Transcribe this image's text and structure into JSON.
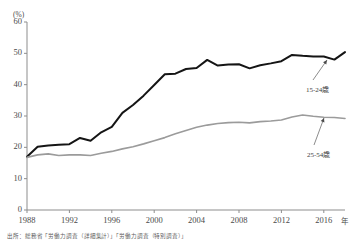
{
  "chart_data": {
    "type": "line",
    "title": "",
    "subtitle": "",
    "xlabel": "年",
    "ylabel": "(%)",
    "ylim": [
      0,
      60
    ],
    "xlim": [
      1988,
      2018
    ],
    "ytick_labels": [
      "0",
      "10",
      "20",
      "30",
      "40",
      "50",
      "60"
    ],
    "ytick_values": [
      0,
      10,
      20,
      30,
      40,
      50,
      60
    ],
    "xtick_labels": [
      "1988",
      "1992",
      "1996",
      "2000",
      "2004",
      "2008",
      "2012",
      "2016"
    ],
    "xtick_values": [
      1988,
      1992,
      1996,
      2000,
      2004,
      2008,
      2012,
      2016
    ],
    "grid": false,
    "legend_position": "inline-annotation",
    "x": [
      1988,
      1989,
      1990,
      1991,
      1992,
      1993,
      1994,
      1995,
      1996,
      1997,
      1998,
      1999,
      2000,
      2001,
      2002,
      2003,
      2004,
      2005,
      2006,
      2007,
      2008,
      2009,
      2010,
      2011,
      2012,
      2013,
      2014,
      2015,
      2016,
      2017,
      2018
    ],
    "series": [
      {
        "name": "15-24歳",
        "color": "#151515",
        "width": 2.0,
        "values": [
          17.0,
          20.2,
          20.6,
          20.8,
          21.0,
          23.0,
          22.1,
          24.8,
          26.5,
          31.0,
          33.5,
          36.5,
          39.9,
          43.3,
          43.5,
          45.0,
          45.3,
          47.9,
          46.1,
          46.4,
          46.5,
          45.2,
          46.2,
          46.8,
          47.5,
          49.5,
          49.2,
          49.0,
          49.0,
          48.0,
          50.4
        ]
      },
      {
        "name": "25-54歳",
        "color": "#9b9b9b",
        "width": 1.6,
        "values": [
          16.8,
          17.6,
          17.9,
          17.4,
          17.6,
          17.6,
          17.4,
          18.1,
          18.7,
          19.5,
          20.2,
          21.1,
          22.1,
          23.1,
          24.3,
          25.4,
          26.4,
          27.1,
          27.6,
          27.9,
          28.0,
          27.8,
          28.2,
          28.4,
          28.7,
          29.7,
          30.3,
          29.9,
          29.6,
          29.5,
          29.2
        ]
      }
    ],
    "annotations": [
      {
        "text": "15-24歳",
        "series": "15-24歳",
        "x": 306,
        "y": 84,
        "pointer_from_x": 313,
        "pointer_from_y": 80,
        "pointer_to_x": 327,
        "pointer_to_y": 60
      },
      {
        "text": "25-54歳",
        "series": "25-54歳",
        "x": 307,
        "y": 149,
        "pointer_from_x": 314,
        "pointer_from_y": 145,
        "pointer_to_x": 324,
        "pointer_to_y": 118
      }
    ]
  },
  "footer": {
    "source_note": "出所：総務省「労働力調査（詳細集計）」「労働力調査（特別調査）」"
  }
}
